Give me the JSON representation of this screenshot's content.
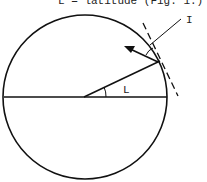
{
  "diagram": {
    "caption_partial": "L = latitude (Fig. 1.)",
    "labels": {
      "angle": "L",
      "pointer": "I"
    },
    "elements": [
      "circle",
      "equator-line",
      "radius-line",
      "tangent-line-dashed",
      "arrow",
      "latitude-angle-arc",
      "leader-line"
    ],
    "colors": {
      "stroke": "#111111",
      "background": "#ffffff"
    }
  }
}
